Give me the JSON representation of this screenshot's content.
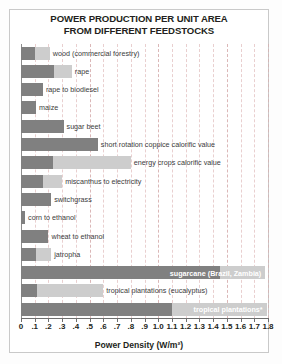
{
  "chart_data": {
    "type": "bar",
    "orientation": "horizontal",
    "stacked": true,
    "title": "POWER PRODUCTION PER UNIT AREA FROM DIFFERENT FEEDSTOCKS",
    "title_lines": [
      "POWER PRODUCTION PER UNIT AREA",
      "FROM DIFFERENT FEEDSTOCKS"
    ],
    "xlabel": "Power Density (W/m²)",
    "ylabel": "",
    "xlim": [
      0,
      1.8
    ],
    "xtick_step": 0.1,
    "xticks": [
      0,
      0.1,
      0.2,
      0.3,
      0.4,
      0.5,
      0.6,
      0.7,
      0.8,
      0.9,
      1.0,
      1.1,
      1.2,
      1.3,
      1.4,
      1.5,
      1.6,
      1.7,
      1.8
    ],
    "xticklabels": [
      "0",
      ".1",
      ".2",
      ".3",
      ".4",
      ".5",
      ".6",
      ".7",
      ".8",
      ".9",
      "1.0",
      "1.1",
      "1.2",
      "1.3",
      "1.4",
      "1.5",
      "1.6",
      "1.7",
      "1.8"
    ],
    "grid": true,
    "legend": null,
    "series": [
      {
        "name": "lower estimate",
        "color": "#808080"
      },
      {
        "name": "upper estimate",
        "color": "#cdcdcd"
      }
    ],
    "categories": [
      "wood (commercial forestry)",
      "rape",
      "rape to biodiesel",
      "maize",
      "sugar beet",
      "short rotation coppice calorific value",
      "energy crops calorific value",
      "miscanthus to electricity",
      "switchgrass",
      "corn to ethanol",
      "wheat to ethanol",
      "jatropha",
      "sugarcane (Brazil, Zambia)",
      "tropical plantations (eucalyptus)",
      "tropical plantations*"
    ],
    "bars": [
      {
        "label": "wood (commercial forestry)",
        "low": 0.1,
        "high": 0.21,
        "label_pos": "outside"
      },
      {
        "label": "rape",
        "low": 0.24,
        "high": 0.37,
        "label_pos": "outside"
      },
      {
        "label": "rape to biodiesel",
        "low": 0.16,
        "high": 0.16,
        "label_pos": "outside"
      },
      {
        "label": "maize",
        "low": 0.11,
        "high": 0.11,
        "label_pos": "outside"
      },
      {
        "label": "sugar beet",
        "low": 0.31,
        "high": 0.31,
        "label_pos": "outside"
      },
      {
        "label": "short rotation coppice calorific value",
        "low": 0.56,
        "high": 0.56,
        "label_pos": "outside"
      },
      {
        "label": "energy crops calorific value",
        "low": 0.23,
        "high": 0.8,
        "label_pos": "outside"
      },
      {
        "label": "miscanthus to electricity",
        "low": 0.16,
        "high": 0.3,
        "label_pos": "outside"
      },
      {
        "label": "switchgrass",
        "low": 0.22,
        "high": 0.22,
        "label_pos": "outside"
      },
      {
        "label": "corn to ethanol",
        "low": 0.03,
        "high": 0.03,
        "label_pos": "outside"
      },
      {
        "label": "wheat to ethanol",
        "low": 0.2,
        "high": 0.2,
        "label_pos": "outside"
      },
      {
        "label": "jatropha",
        "low": 0.11,
        "high": 0.22,
        "label_pos": "outside"
      },
      {
        "label": "sugarcane (Brazil, Zambia)",
        "low": 1.45,
        "high": 1.78,
        "label_pos": "inside"
      },
      {
        "label": "tropical plantations (eucalyptus)",
        "low": 0.12,
        "high": 0.6,
        "label_pos": "outside"
      },
      {
        "label": "tropical plantations*",
        "low": 1.1,
        "high": 1.79,
        "label_pos": "inside"
      }
    ]
  },
  "colors": {
    "bar_dark": "#808080",
    "bar_light": "#cdcdcd",
    "grid": "#d8a8a8",
    "text": "#231f20",
    "frame": "#c9c9c9",
    "label_inside": "#ffffff"
  }
}
